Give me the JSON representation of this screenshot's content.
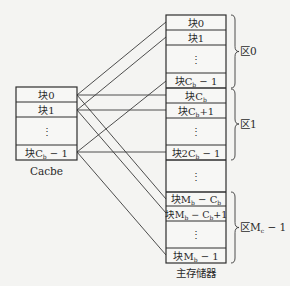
{
  "diagram": {
    "colors": {
      "background": "#f4f4f2",
      "stroke": "#3a3a3a",
      "text": "#2a2a2a"
    },
    "cache": {
      "label": "Cacbe",
      "blocks": [
        {
          "id": "c0",
          "prefix": "块",
          "main": "0",
          "sub": "",
          "suffix": ""
        },
        {
          "id": "c1",
          "prefix": "块",
          "main": "1",
          "sub": "",
          "suffix": ""
        },
        {
          "id": "cdots",
          "prefix": "",
          "main": "⋮",
          "sub": "",
          "suffix": ""
        },
        {
          "id": "clast",
          "prefix": "块",
          "main": "C",
          "sub": "b",
          "suffix": " − 1"
        }
      ]
    },
    "memory": {
      "label": "主存储器",
      "blocks": [
        {
          "id": "m0",
          "prefix": "块",
          "main": "0",
          "sub": "",
          "suffix": ""
        },
        {
          "id": "m1",
          "prefix": "块",
          "main": "1",
          "sub": "",
          "suffix": ""
        },
        {
          "id": "mdots0",
          "prefix": "",
          "main": "⋮",
          "sub": "",
          "suffix": ""
        },
        {
          "id": "mCb-1",
          "prefix": "块",
          "main": "C",
          "sub": "b",
          "suffix": " − 1"
        },
        {
          "id": "mCb",
          "prefix": "块",
          "main": "C",
          "sub": "b",
          "suffix": ""
        },
        {
          "id": "mCb+1",
          "prefix": "块",
          "main": "C",
          "sub": "b",
          "suffix": "+1"
        },
        {
          "id": "mdots1",
          "prefix": "",
          "main": "⋮",
          "sub": "",
          "suffix": ""
        },
        {
          "id": "m2Cb-1",
          "prefix": "块",
          "main": "2C",
          "sub": "b",
          "suffix": " − 1"
        },
        {
          "id": "mdots2",
          "prefix": "",
          "main": "⋮",
          "sub": "",
          "suffix": ""
        },
        {
          "id": "mMb-Cb",
          "prefix": "块",
          "main": "M",
          "sub": "b",
          "suffix": " − C",
          "sub2": "b"
        },
        {
          "id": "mMb-Cb+1",
          "prefix": "块",
          "main": "M",
          "sub": "b",
          "suffix": " − C",
          "sub2": "b",
          "suffix2": "+1"
        },
        {
          "id": "mdots3",
          "prefix": "",
          "main": "⋮",
          "sub": "",
          "suffix": ""
        },
        {
          "id": "mMb-1",
          "prefix": "块",
          "main": "M",
          "sub": "b",
          "suffix": " − 1"
        }
      ]
    },
    "regions": [
      {
        "label": "区0",
        "main": "区0",
        "sub": "",
        "suffix": ""
      },
      {
        "label": "区1",
        "main": "区1",
        "sub": "",
        "suffix": ""
      },
      {
        "label": "区M_c − 1",
        "main": "区M",
        "sub": "c",
        "suffix": " − 1"
      }
    ],
    "mappings": [
      {
        "from": "c0",
        "to": [
          "m0",
          "mCb",
          "mMb-Cb"
        ]
      },
      {
        "from": "c1",
        "to": [
          "m1",
          "mCb+1",
          "mMb-Cb+1"
        ]
      },
      {
        "from": "clast",
        "to": [
          "mCb-1",
          "m2Cb-1",
          "mMb-1"
        ]
      }
    ]
  }
}
